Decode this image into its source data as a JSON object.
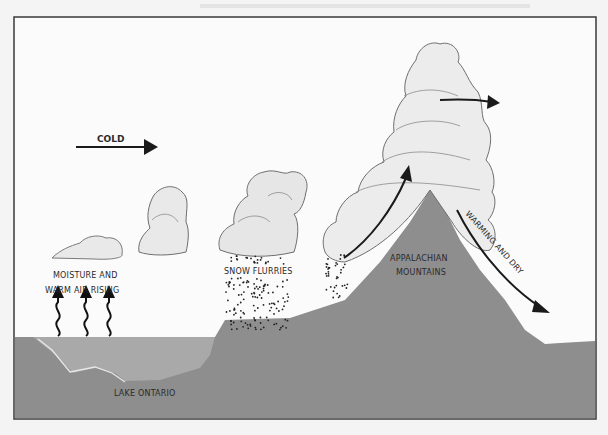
{
  "diagram": {
    "colors": {
      "ground": "#8e8e8e",
      "lake": "#a9a9a9",
      "sky": "#fbfbfb",
      "cloud_fill": "#e9e9e9",
      "cloud_edge": "#6e6e6e",
      "arrow": "#1a1a1a",
      "frame": "#3a3a3a"
    },
    "labels": {
      "cold": "COLD",
      "moisture_line1": "MOISTURE AND",
      "moisture_line2": "WARM AIR RISING",
      "snow_flurries": "SNOW FLURRIES",
      "mountains_line1": "APPALACHIAN",
      "mountains_line2": "MOUNTAINS",
      "warming_dry": "WARMING AND DRY",
      "lake": "LAKE ONTARIO"
    },
    "icons": {
      "cold_arrow": "right-arrow",
      "rising_air": "wavy-up-arrow",
      "updraft": "curved-up-arrow",
      "outflow": "right-arrow",
      "downslope": "down-right-arrow"
    }
  }
}
